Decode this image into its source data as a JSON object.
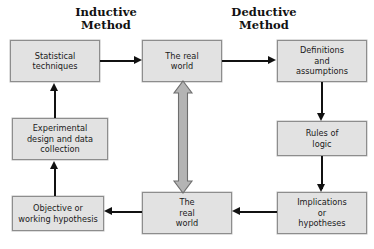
{
  "diagram": {
    "titles": [
      {
        "id": "inductive",
        "text": "Inductive\nMethod"
      },
      {
        "id": "deductive",
        "text": "Deductive\nMethod"
      }
    ],
    "nodes": [
      {
        "id": "statistical-techniques",
        "text": "Statistical\ntechniques"
      },
      {
        "id": "real-world-top",
        "text": "The real\nworld"
      },
      {
        "id": "definitions-assumptions",
        "text": "Definitions\nand\nassumptions"
      },
      {
        "id": "experimental-design",
        "text": "Experimental\ndesign and data\ncollection"
      },
      {
        "id": "rules-of-logic",
        "text": "Rules of\nlogic"
      },
      {
        "id": "objective-hypothesis",
        "text": "Objective or\nworking hypothesis"
      },
      {
        "id": "real-world-bottom",
        "text": "The\nreal\nworld"
      },
      {
        "id": "implications-hypotheses",
        "text": "Implications\nor\nhypotheses"
      }
    ],
    "connectors": [
      {
        "id": "statistical-to-realworld",
        "from": "statistical-techniques",
        "to": "real-world-top",
        "direction": "right"
      },
      {
        "id": "realworld-to-definitions",
        "from": "real-world-top",
        "to": "definitions-assumptions",
        "direction": "right"
      },
      {
        "id": "definitions-to-rules",
        "from": "definitions-assumptions",
        "to": "rules-of-logic",
        "direction": "down"
      },
      {
        "id": "rules-to-implications",
        "from": "rules-of-logic",
        "to": "implications-hypotheses",
        "direction": "down"
      },
      {
        "id": "implications-to-realworld",
        "from": "implications-hypotheses",
        "to": "real-world-bottom",
        "direction": "left"
      },
      {
        "id": "realworld-to-objective",
        "from": "real-world-bottom",
        "to": "objective-hypothesis",
        "direction": "left"
      },
      {
        "id": "objective-to-experimental",
        "from": "objective-hypothesis",
        "to": "experimental-design",
        "direction": "up"
      },
      {
        "id": "experimental-to-statistical",
        "from": "experimental-design",
        "to": "statistical-techniques",
        "direction": "up"
      },
      {
        "id": "realworld-vertical-link",
        "from": "real-world-top",
        "to": "real-world-bottom",
        "direction": "both"
      }
    ],
    "colors": {
      "node_fill": "#e2e2e2",
      "node_border": "#8d8d8d",
      "connector": "#111111",
      "double_arrow_fill": "#b4b4b4",
      "double_arrow_border": "#6e6e6e",
      "background": "#ffffff",
      "text": "#1a1a1a"
    }
  }
}
